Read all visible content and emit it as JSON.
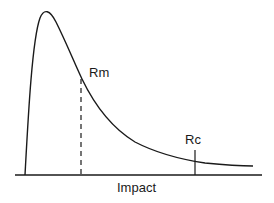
{
  "diagram": {
    "type": "distribution-curve",
    "x_axis_label": "Impact",
    "markers": [
      {
        "label": "Rm",
        "style": "dashed"
      },
      {
        "label": "Rc",
        "style": "solid"
      }
    ]
  },
  "colors": {
    "line": "#1a1a1a",
    "background": "#ffffff"
  }
}
